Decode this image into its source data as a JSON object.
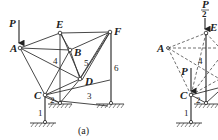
{
  "figure_a": {
    "caption": "(a)",
    "load_label": "P",
    "nodes": {
      "A": "A",
      "E": "E",
      "B": "B",
      "F": "F",
      "D": "D",
      "C": "C"
    },
    "members": {
      "m1": "1",
      "m2": "2",
      "m3": "3",
      "m4": "4",
      "m5": "5",
      "m6": "6"
    }
  },
  "figure_b": {
    "top_load_num": "P",
    "top_load_den": "2",
    "load_label": "P",
    "nodes": {
      "A": "A",
      "E": "E",
      "C": "C"
    },
    "members": {
      "m1": "1",
      "m2": "2",
      "m4": "4"
    }
  },
  "colors": {
    "ink": "#222222",
    "background": "#ffffff"
  }
}
